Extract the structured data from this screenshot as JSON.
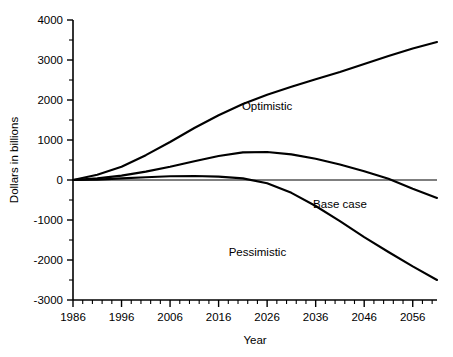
{
  "chart_data": {
    "type": "line",
    "title": "",
    "xlabel": "Year",
    "ylabel": "Dollars in billions",
    "xlim": [
      1986,
      2061
    ],
    "ylim": [
      -3000,
      4000
    ],
    "grid": false,
    "legend_position": "inline-labels",
    "x_tick_labels": [
      "1986",
      "1996",
      "2006",
      "2016",
      "2026",
      "2036",
      "2046",
      "2056"
    ],
    "x_ticks": [
      1986,
      1996,
      2006,
      2016,
      2026,
      2036,
      2046,
      2056
    ],
    "x_minor_tick_step": 2,
    "y_tick_labels": [
      "4000",
      "3000",
      "2000",
      "1000",
      "0",
      "-1000",
      "-2000",
      "-3000"
    ],
    "y_ticks": [
      4000,
      3000,
      2000,
      1000,
      0,
      -1000,
      -2000,
      -3000
    ],
    "y_minor_tick_step": 500,
    "series": [
      {
        "name": "Optimistic",
        "label": "Optimistic",
        "label_x": 2026,
        "label_y": 1750,
        "x": [
          1986,
          1991,
          1996,
          2001,
          2006,
          2011,
          2016,
          2021,
          2026,
          2031,
          2036,
          2041,
          2046,
          2051,
          2056,
          2061
        ],
        "values": [
          0,
          130,
          330,
          620,
          950,
          1300,
          1620,
          1900,
          2130,
          2330,
          2520,
          2700,
          2900,
          3100,
          3290,
          3450
        ]
      },
      {
        "name": "Base case",
        "label": "Base case",
        "label_x": 2041,
        "label_y": -700,
        "x": [
          1986,
          1991,
          1996,
          2001,
          2006,
          2011,
          2016,
          2021,
          2026,
          2031,
          2036,
          2041,
          2046,
          2051,
          2056,
          2061
        ],
        "values": [
          0,
          40,
          110,
          210,
          330,
          470,
          600,
          690,
          700,
          640,
          530,
          390,
          220,
          30,
          -220,
          -450
        ]
      },
      {
        "name": "Pessimistic",
        "label": "Pessimistic",
        "label_x": 2024,
        "label_y": -1900,
        "x": [
          1986,
          1991,
          1996,
          2001,
          2006,
          2011,
          2016,
          2021,
          2026,
          2031,
          2036,
          2041,
          2046,
          2051,
          2056,
          2061
        ],
        "values": [
          0,
          10,
          40,
          70,
          95,
          100,
          85,
          40,
          -80,
          -320,
          -650,
          -1030,
          -1430,
          -1800,
          -2160,
          -2500
        ]
      }
    ]
  }
}
